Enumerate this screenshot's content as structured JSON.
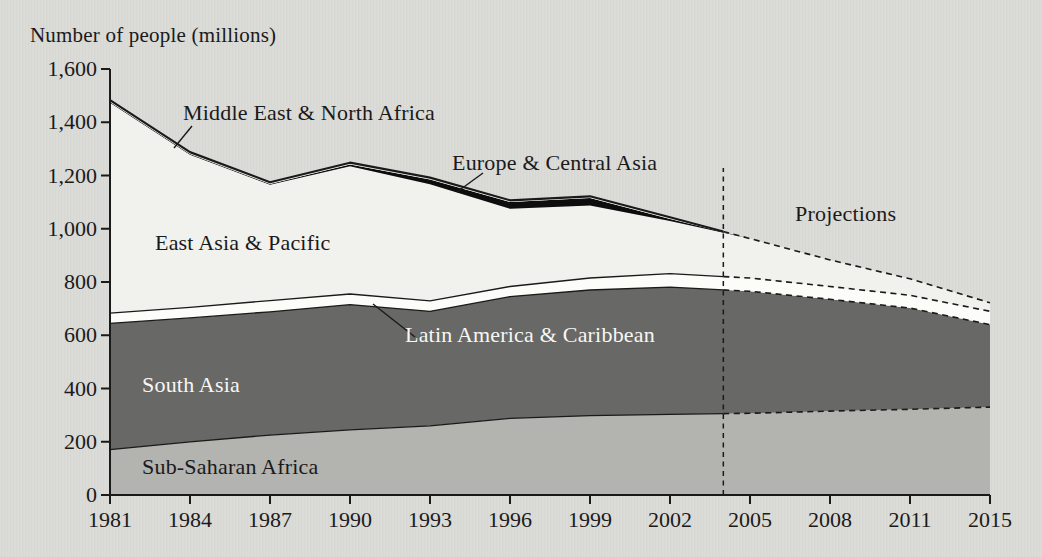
{
  "page": {
    "background": "#dadad6",
    "ink": "#1a1a1a",
    "light_text": "#f7f7f4"
  },
  "chart_data": {
    "type": "area",
    "stacked": true,
    "title": "Number of people (millions)",
    "categories": [
      "1981",
      "1984",
      "1987",
      "1990",
      "1993",
      "1996",
      "1999",
      "2002",
      "2005",
      "2008",
      "2011",
      "2015"
    ],
    "ylim": [
      0,
      1600
    ],
    "ytick_step": 200,
    "ytick_labels": [
      "0",
      "200",
      "400",
      "600",
      "800",
      "1,000",
      "1,200",
      "1,400",
      "1,600"
    ],
    "grid": false,
    "legend_position": "labels inside plot areas with leader lines",
    "projection_start_year": 2004,
    "projection_divider_style": "dashed",
    "series": [
      {
        "name": "Sub-Saharan Africa",
        "color": "#b3b3b0",
        "values": [
          170,
          200,
          225,
          245,
          260,
          288,
          298,
          303,
          307,
          315,
          322,
          330
        ]
      },
      {
        "name": "South Asia",
        "color": "#686866",
        "values": [
          475,
          465,
          463,
          470,
          430,
          457,
          472,
          478,
          458,
          420,
          380,
          310
        ]
      },
      {
        "name": "Latin America & Caribbean",
        "color": "#fcfcf9",
        "values": [
          38,
          40,
          42,
          40,
          39,
          38,
          45,
          50,
          50,
          48,
          48,
          50
        ]
      },
      {
        "name": "East Asia & Pacific",
        "color": "#f1f1ed",
        "values": [
          790,
          573,
          435,
          480,
          438,
          292,
          272,
          198,
          148,
          100,
          62,
          32
        ]
      },
      {
        "name": "Europe & Central Asia",
        "color": "#0d0d0d",
        "values": [
          3,
          3,
          3,
          6,
          18,
          25,
          28,
          8,
          0,
          0,
          0,
          0
        ]
      },
      {
        "name": "Middle East & North Africa",
        "color": "#f1f1ed",
        "values": [
          7,
          7,
          7,
          7,
          7,
          7,
          7,
          6,
          0,
          0,
          0,
          0
        ]
      }
    ],
    "annotations": [
      {
        "id": "mena-label",
        "text": "Middle East & North Africa"
      },
      {
        "id": "eca-label",
        "text": "Europe & Central Asia"
      },
      {
        "id": "eap-label",
        "text": "East Asia & Pacific"
      },
      {
        "id": "lac-label",
        "text": "Latin America & Caribbean"
      },
      {
        "id": "south-asia-label",
        "text": "South Asia"
      },
      {
        "id": "ssa-label",
        "text": "Sub-Saharan Africa"
      },
      {
        "id": "projections-label",
        "text": "Projections"
      }
    ]
  }
}
